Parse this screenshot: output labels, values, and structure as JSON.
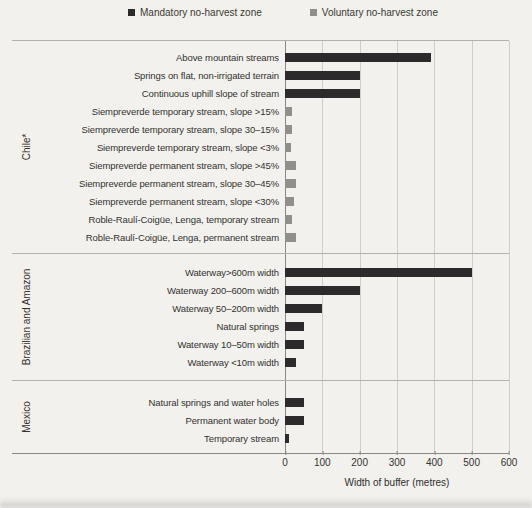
{
  "legend": {
    "items": [
      {
        "key": "mandatory",
        "label": "Mandatory no-harvest zone",
        "color": "#2d2a2b"
      },
      {
        "key": "voluntary",
        "label": "Voluntary no-harvest zone",
        "color": "#908f8c"
      }
    ]
  },
  "chart_data": {
    "type": "bar",
    "orientation": "horizontal",
    "xlabel": "Width of buffer (metres)",
    "xlim": [
      0,
      600
    ],
    "xticks": [
      0,
      100,
      200,
      300,
      400,
      500,
      600
    ],
    "grid": true,
    "legend_position": "top",
    "series_colors": {
      "mandatory": "#2d2a2b",
      "voluntary": "#908f8c"
    },
    "groups": [
      {
        "name": "Chile*",
        "rows": [
          {
            "label": "Above mountain streams",
            "series": "mandatory",
            "value": 390
          },
          {
            "label": "Springs on flat, non-irrigated terrain",
            "series": "mandatory",
            "value": 200
          },
          {
            "label": "Continuous uphill slope of stream",
            "series": "mandatory",
            "value": 200
          },
          {
            "label": "Siempreverde temporary stream, slope >15%",
            "series": "voluntary",
            "value": 20
          },
          {
            "label": "Siempreverde temporary stream, slope 30–15%",
            "series": "voluntary",
            "value": 20
          },
          {
            "label": "Siempreverde temporary stream, slope <3%",
            "series": "voluntary",
            "value": 15
          },
          {
            "label": "Siempreverde permanent stream, slope >45%",
            "series": "voluntary",
            "value": 30
          },
          {
            "label": "Siempreverde permanent stream, slope 30–45%",
            "series": "voluntary",
            "value": 30
          },
          {
            "label": "Siempreverde permanent stream, slope <30%",
            "series": "voluntary",
            "value": 25
          },
          {
            "label": "Roble-Raulí-Coigüe, Lenga, temporary stream",
            "series": "voluntary",
            "value": 20
          },
          {
            "label": "Roble-Raulí-Coigüe, Lenga, permanent stream",
            "series": "voluntary",
            "value": 30
          }
        ]
      },
      {
        "name": "Brazilian and Amazon",
        "rows": [
          {
            "label": "Waterway>600m width",
            "series": "mandatory",
            "value": 500
          },
          {
            "label": "Waterway 200–600m width",
            "series": "mandatory",
            "value": 200
          },
          {
            "label": "Waterway 50–200m width",
            "series": "mandatory",
            "value": 100
          },
          {
            "label": "Natural springs",
            "series": "mandatory",
            "value": 50
          },
          {
            "label": "Waterway 10–50m width",
            "series": "mandatory",
            "value": 50
          },
          {
            "label": "Waterway <10m width",
            "series": "mandatory",
            "value": 30
          }
        ]
      },
      {
        "name": "Mexico",
        "rows": [
          {
            "label": "Natural springs and water holes",
            "series": "mandatory",
            "value": 50
          },
          {
            "label": "Permanent water body",
            "series": "mandatory",
            "value": 50
          },
          {
            "label": "Temporary stream",
            "series": "mandatory",
            "value": 10
          }
        ]
      }
    ]
  }
}
